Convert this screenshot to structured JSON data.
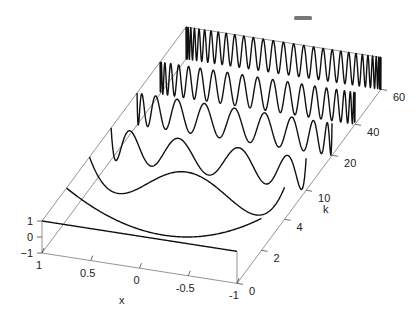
{
  "chart_data": {
    "type": "line",
    "subtype": "3d-waterfall",
    "title": "",
    "xlabel": "x",
    "ylabel": "k",
    "zlabel": "",
    "xlim": [
      -1,
      1
    ],
    "zlim": [
      -1,
      1
    ],
    "x_ticks": [
      "1",
      "0.5",
      "0",
      "-0.5",
      "-1"
    ],
    "x_tick_values": [
      1,
      0.5,
      0,
      -0.5,
      -1
    ],
    "k_ticks": [
      "0",
      "2",
      "4",
      "10",
      "20",
      "40",
      "60"
    ],
    "k_tick_values": [
      0,
      2,
      4,
      10,
      20,
      40,
      60
    ],
    "z_ticks": [
      "1",
      "0",
      "−1"
    ],
    "z_tick_values": [
      1,
      0,
      -1
    ],
    "series": [
      {
        "name": "T_0(x)",
        "k": 0,
        "function": "cos(0*acos(x))"
      },
      {
        "name": "T_2(x)",
        "k": 2,
        "function": "cos(2*acos(x))"
      },
      {
        "name": "T_4(x)",
        "k": 4,
        "function": "cos(4*acos(x))"
      },
      {
        "name": "T_10(x)",
        "k": 10,
        "function": "cos(10*acos(x))"
      },
      {
        "name": "T_20(x)",
        "k": 20,
        "function": "cos(20*acos(x))"
      },
      {
        "name": "T_40(x)",
        "k": 40,
        "function": "cos(40*acos(x))"
      },
      {
        "name": "T_60(x)",
        "k": 60,
        "function": "cos(60*acos(x))"
      }
    ],
    "grid": false,
    "legend": null
  },
  "labels": {
    "x_axis": "x",
    "k_axis": "k"
  }
}
